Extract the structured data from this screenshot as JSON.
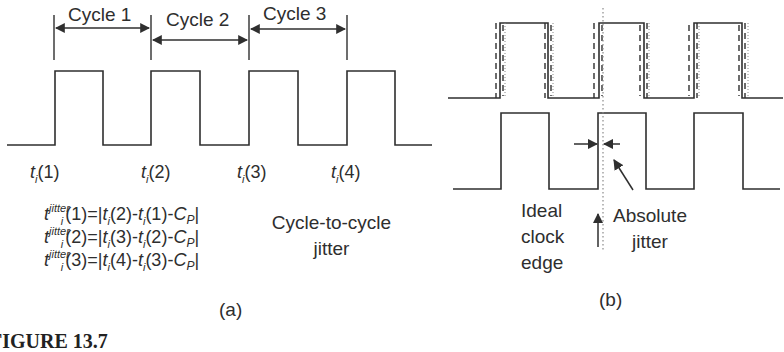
{
  "panel_a": {
    "cycle_labels": [
      "Cycle 1",
      "Cycle 2",
      "Cycle 3"
    ],
    "time_labels": [
      {
        "base": "t",
        "sub": "i",
        "arg": "(1)"
      },
      {
        "base": "t",
        "sub": "i",
        "arg": "(2)"
      },
      {
        "base": "t",
        "sub": "i",
        "arg": "(3)"
      },
      {
        "base": "t",
        "sub": "i",
        "arg": "(4)"
      }
    ],
    "equations": [
      {
        "lhs_sup": "jitter",
        "lhs_sub": "i",
        "idx": "(1)",
        "rhs": "=|t",
        "a": "(2)",
        "b": "(1)",
        "cp": "C",
        "cp_sub": "P"
      },
      {
        "lhs_sup": "jitter",
        "lhs_sub": "i",
        "idx": "(2)",
        "rhs": "=|t",
        "a": "(3)",
        "b": "(2)",
        "cp": "C",
        "cp_sub": "P"
      },
      {
        "lhs_sup": "jitter",
        "lhs_sub": "i",
        "idx": "(3)",
        "rhs": "=|t",
        "a": "(4)",
        "b": "(3)",
        "cp": "C",
        "cp_sub": "P"
      }
    ],
    "description_line1": "Cycle-to-cycle",
    "description_line2": "jitter",
    "panel_label": "(a)"
  },
  "panel_b": {
    "ideal_label_lines": [
      "Ideal",
      "clock",
      "edge"
    ],
    "absolute_label_lines": [
      "Absolute",
      "jitter"
    ],
    "panel_label": "(b)"
  },
  "caption": "FIGURE 13.7",
  "colors": {
    "stroke": "#2f2f2f",
    "dotted": "#8a8a8a",
    "background": "#ffffff"
  }
}
